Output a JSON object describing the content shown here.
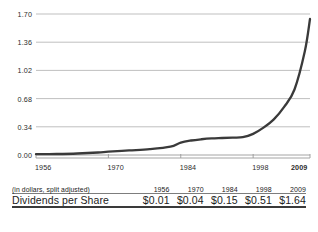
{
  "chart_data": {
    "type": "line",
    "title": "",
    "xlabel": "",
    "ylabel": "",
    "grid": true,
    "legend": null,
    "xlim": [
      1956,
      2009
    ],
    "ylim": [
      0.0,
      1.7
    ],
    "y_ticks": [
      "1.70",
      "1.36",
      "1.02",
      "0.68",
      "0.34",
      "0.00"
    ],
    "y_tick_values": [
      1.7,
      1.36,
      1.02,
      0.68,
      0.34,
      0.0
    ],
    "x_ticks": [
      "1956",
      "1970",
      "1984",
      "1998",
      "2009"
    ],
    "x_tick_values": [
      1956,
      1970,
      1984,
      1998,
      2009
    ],
    "x_tick_bold": [
      false,
      false,
      false,
      false,
      true
    ],
    "series": [
      {
        "name": "Dividends per Share",
        "color": "#3a3a3a",
        "x": [
          1956,
          1960,
          1964,
          1968,
          1970,
          1974,
          1978,
          1982,
          1984,
          1986,
          1988,
          1990,
          1992,
          1994,
          1996,
          1998,
          2000,
          2002,
          2004,
          2006,
          2008,
          2009
        ],
        "y": [
          0.01,
          0.012,
          0.018,
          0.03,
          0.04,
          0.055,
          0.07,
          0.1,
          0.15,
          0.175,
          0.19,
          0.2,
          0.205,
          0.21,
          0.215,
          0.255,
          0.33,
          0.43,
          0.58,
          0.79,
          1.25,
          1.64
        ]
      }
    ]
  },
  "table": {
    "header": {
      "label": "(in dollars, split adjusted)",
      "years": [
        "1956",
        "1970",
        "1984",
        "1998",
        "2009"
      ]
    },
    "rows": [
      {
        "label": "Dividends per Share",
        "values": [
          "$0.01",
          "$0.04",
          "$0.15",
          "$0.51",
          "$1.64"
        ],
        "bold_flags": [
          false,
          false,
          false,
          false,
          true
        ]
      }
    ]
  },
  "colors": {
    "line": "#3a3a3a",
    "grid": "#b8b8b8",
    "axis": "#9a9a9a",
    "text": "#222222",
    "rule_dark": "#3a3a3a",
    "rule_light": "#7d7d7d"
  }
}
